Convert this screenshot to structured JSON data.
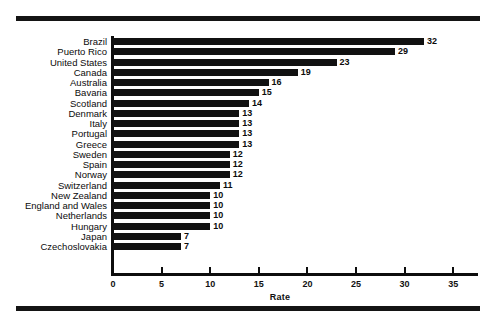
{
  "chart_data": {
    "type": "bar",
    "orientation": "horizontal",
    "title": "",
    "subtitle": "",
    "xlabel": "Rate",
    "ylabel": "",
    "xlim": [
      0,
      36.5
    ],
    "xticks": [
      0,
      5,
      10,
      15,
      20,
      25,
      30,
      35
    ],
    "xtick_labels": [
      "0",
      "5",
      "10",
      "15",
      "20",
      "25",
      "30",
      "35"
    ],
    "grid": false,
    "legend": null,
    "bar_color": "#111111",
    "categories": [
      "Brazil",
      "Puerto Rico",
      "United States",
      "Canada",
      "Australia",
      "Bavaria",
      "Scotland",
      "Denmark",
      "Italy",
      "Portugal",
      "Greece",
      "Sweden",
      "Spain",
      "Norway",
      "Switzerland",
      "New Zealand",
      "England and Wales",
      "Netherlands",
      "Hungary",
      "Japan",
      "Czechoslovakia"
    ],
    "values": [
      32,
      29,
      23,
      19,
      16,
      15,
      14,
      13,
      13,
      13,
      13,
      12,
      12,
      12,
      11,
      10,
      10,
      10,
      10,
      7,
      7
    ],
    "value_labels": [
      "32",
      "29",
      "23",
      "19",
      "16",
      "15",
      "14",
      "13",
      "13",
      "13",
      "13",
      "12",
      "12",
      "12",
      "11",
      "10",
      "10",
      "10",
      "10",
      "7",
      "7"
    ]
  },
  "decor": {
    "rule_color": "#141414"
  }
}
